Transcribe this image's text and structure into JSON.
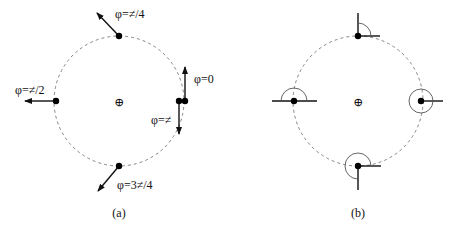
{
  "figure": {
    "panels": [
      {
        "id": "a",
        "caption": "(a)",
        "center_symbol": "⊕",
        "labels": {
          "top": "φ=≠/4",
          "right_up": "φ=0",
          "right_down": "φ=≠",
          "left": "φ=≠/2",
          "bottom": "φ=3≠/4"
        }
      },
      {
        "id": "b",
        "caption": "(b)",
        "center_symbol": "⊕"
      }
    ],
    "colors": {
      "ink": "#111111",
      "orbit": "#777777",
      "arc": "#555555",
      "background": "#ffffff"
    }
  }
}
